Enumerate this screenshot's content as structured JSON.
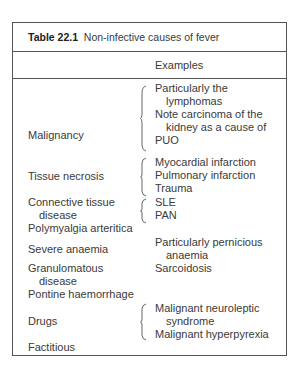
{
  "table": {
    "number": "Table 22.1",
    "caption": "Non-infective causes of fever",
    "header": {
      "cause": "",
      "examples": "Examples"
    },
    "rows": [
      {
        "cause": [
          "Malignancy"
        ],
        "examples": [
          "Particularly the",
          "lymphomas",
          "Note carcinoma of the",
          "kidney as a cause of",
          "PUO"
        ],
        "brace": true
      },
      {
        "cause": [
          "Tissue necrosis"
        ],
        "examples": [
          "Myocardial infarction",
          "Pulmonary infarction",
          "Trauma"
        ],
        "brace": true
      },
      {
        "cause": [
          "Connective tissue",
          "disease"
        ],
        "examples": [
          "SLE",
          "PAN"
        ],
        "brace": true
      },
      {
        "cause": [
          "Polymyalgia arteritica"
        ],
        "examples": [],
        "brace": false
      },
      {
        "cause": [
          "Severe anaemia"
        ],
        "examples": [
          "Particularly pernicious",
          "anaemia"
        ],
        "brace": false
      },
      {
        "cause": [
          "Granulomatous",
          "disease"
        ],
        "examples": [
          "Sarcoidosis"
        ],
        "brace": false
      },
      {
        "cause": [
          "Pontine haemorrhage"
        ],
        "examples": [],
        "brace": false
      },
      {
        "cause": [
          "Drugs"
        ],
        "examples": [
          "Malignant neuroleptic",
          "syndrome",
          "Malignant hyperpyrexia"
        ],
        "brace": true
      },
      {
        "cause": [
          "Factitious"
        ],
        "examples": [],
        "brace": false
      }
    ]
  },
  "colors": {
    "text": "#3a3a3a",
    "border": "#555555",
    "background": "#ffffff"
  }
}
